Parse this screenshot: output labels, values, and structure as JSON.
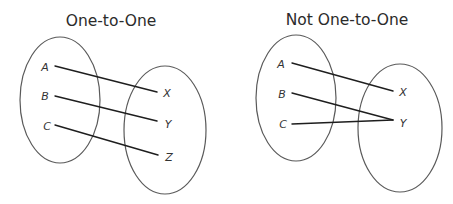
{
  "diagrams": [
    {
      "title": "One-to-One",
      "domain": {
        "labels": [
          "A",
          "B",
          "C"
        ],
        "ellipse": {
          "cx": 60,
          "cy": 100,
          "rx": 40,
          "ry": 63
        }
      },
      "codomain": {
        "labels": [
          "X",
          "Y",
          "Z"
        ],
        "ellipse": {
          "cx": 165,
          "cy": 130,
          "rx": 41,
          "ry": 64
        }
      },
      "mappings": [
        {
          "from": "A",
          "to": "X"
        },
        {
          "from": "B",
          "to": "Y"
        },
        {
          "from": "C",
          "to": "Z"
        }
      ]
    },
    {
      "title": "Not One-to-One",
      "domain": {
        "labels": [
          "A",
          "B",
          "C"
        ],
        "ellipse": {
          "cx": 296,
          "cy": 98,
          "rx": 40,
          "ry": 63
        }
      },
      "codomain": {
        "labels": [
          "X",
          "Y"
        ],
        "ellipse": {
          "cx": 400,
          "cy": 128,
          "rx": 42,
          "ry": 64
        }
      },
      "mappings": [
        {
          "from": "A",
          "to": "X"
        },
        {
          "from": "B",
          "to": "Y"
        },
        {
          "from": "C",
          "to": "Y"
        }
      ]
    }
  ],
  "colors": {
    "title": "#2b2b2b",
    "ellipse_stroke": "#5a5a5a",
    "mapping_line": "#1e1e1e",
    "label": "#333333",
    "background": "#ffffff"
  }
}
